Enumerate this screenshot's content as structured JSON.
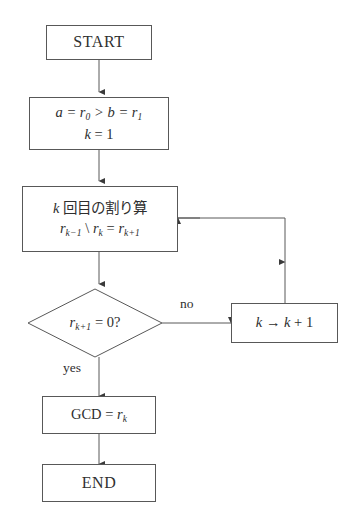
{
  "diagram": {
    "stroke_color": "#585858",
    "text_color": "#2e2e2e",
    "background": "#ffffff"
  },
  "nodes": {
    "start": {
      "label": "START"
    },
    "init": {
      "line1_a": "a",
      "line1_eq1": " = ",
      "line1_r0": "r",
      "line1_r0_sub": "0",
      "line1_gt": " > ",
      "line1_b": "b",
      "line1_eq2": " = ",
      "line1_r1": "r",
      "line1_r1_sub": "1",
      "line2_k": "k",
      "line2_eq": " = 1"
    },
    "process": {
      "line1_var": "k",
      "line1_jp": " 回目の割り算",
      "line2_r1": "r",
      "line2_r1_sub": "k−1",
      "line2_sep": " \\ ",
      "line2_r2": "r",
      "line2_r2_sub": "k",
      "line2_eq": " = ",
      "line2_r3": "r",
      "line2_r3_sub": "k+1"
    },
    "decision": {
      "r": "r",
      "r_sub": "k+1",
      "rest": " = 0?"
    },
    "increment": {
      "k1": "k",
      "arrow": " → ",
      "k2": "k",
      "plus": " + 1"
    },
    "result": {
      "gcd": "GCD",
      "eq": " = ",
      "r": "r",
      "r_sub": "k"
    },
    "end": {
      "label": "END"
    }
  },
  "edges": {
    "no_label": "no",
    "yes_label": "yes"
  }
}
